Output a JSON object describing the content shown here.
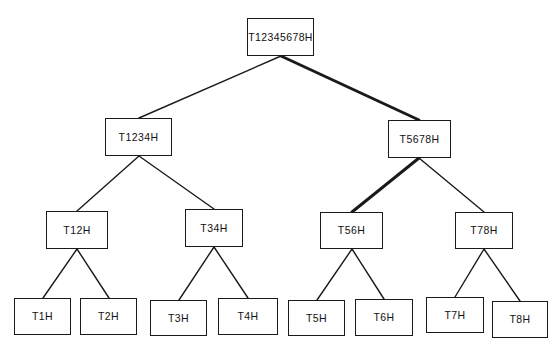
{
  "diagram": {
    "background_color": "#ffffff",
    "edge_color": "#1a1a1a",
    "node_border_color": "#1a1a1a",
    "node_fill_color": "#ffffff",
    "highlight_path_labels": [
      "T12345678H",
      "T5678H",
      "T56H"
    ]
  },
  "nodes": [
    {
      "id": "root",
      "label": "T12345678H",
      "level": 0,
      "x": 247,
      "y": 18,
      "w": 67,
      "h": 38
    },
    {
      "id": "t1234",
      "label": "T1234H",
      "level": 1,
      "x": 105,
      "y": 118,
      "w": 67,
      "h": 38
    },
    {
      "id": "t5678",
      "label": "T5678H",
      "level": 1,
      "x": 388,
      "y": 120,
      "w": 63,
      "h": 38
    },
    {
      "id": "t12",
      "label": "T12H",
      "level": 2,
      "x": 46,
      "y": 211,
      "w": 62,
      "h": 38
    },
    {
      "id": "t34",
      "label": "T34H",
      "level": 2,
      "x": 185,
      "y": 209,
      "w": 58,
      "h": 38
    },
    {
      "id": "t56",
      "label": "T56H",
      "level": 2,
      "x": 320,
      "y": 212,
      "w": 63,
      "h": 37
    },
    {
      "id": "t78",
      "label": "T78H",
      "level": 2,
      "x": 455,
      "y": 212,
      "w": 58,
      "h": 37
    },
    {
      "id": "t1",
      "label": "T1H",
      "level": 3,
      "x": 14,
      "y": 298,
      "w": 57,
      "h": 37
    },
    {
      "id": "t2",
      "label": "T2H",
      "level": 3,
      "x": 80,
      "y": 298,
      "w": 57,
      "h": 37
    },
    {
      "id": "t3",
      "label": "T3H",
      "level": 3,
      "x": 150,
      "y": 300,
      "w": 57,
      "h": 36
    },
    {
      "id": "t4",
      "label": "T4H",
      "level": 3,
      "x": 218,
      "y": 298,
      "w": 60,
      "h": 37
    },
    {
      "id": "t5",
      "label": "T5H",
      "level": 3,
      "x": 288,
      "y": 300,
      "w": 57,
      "h": 36
    },
    {
      "id": "t6",
      "label": "T6H",
      "level": 3,
      "x": 355,
      "y": 299,
      "w": 58,
      "h": 37
    },
    {
      "id": "t7",
      "label": "T7H",
      "level": 3,
      "x": 426,
      "y": 297,
      "w": 58,
      "h": 36
    },
    {
      "id": "t8",
      "label": "T8H",
      "level": 3,
      "x": 492,
      "y": 301,
      "w": 56,
      "h": 37
    }
  ],
  "edges": [
    {
      "from": "root",
      "to": "t1234",
      "x1": 281,
      "y1": 56,
      "x2": 139,
      "y2": 118,
      "weight": "normal",
      "width": 1.4
    },
    {
      "from": "root",
      "to": "t5678",
      "x1": 281,
      "y1": 56,
      "x2": 419,
      "y2": 120,
      "weight": "bold",
      "width": 3.0
    },
    {
      "from": "t1234",
      "to": "t12",
      "x1": 139,
      "y1": 156,
      "x2": 77,
      "y2": 211,
      "weight": "normal",
      "width": 1.4
    },
    {
      "from": "t1234",
      "to": "t34",
      "x1": 139,
      "y1": 156,
      "x2": 214,
      "y2": 209,
      "weight": "normal",
      "width": 1.4
    },
    {
      "from": "t5678",
      "to": "t56",
      "x1": 419,
      "y1": 158,
      "x2": 352,
      "y2": 212,
      "weight": "bold",
      "width": 3.0
    },
    {
      "from": "t5678",
      "to": "t78",
      "x1": 419,
      "y1": 158,
      "x2": 484,
      "y2": 212,
      "weight": "normal",
      "width": 1.4
    },
    {
      "from": "t12",
      "to": "t1",
      "x1": 77,
      "y1": 249,
      "x2": 43,
      "y2": 298,
      "weight": "normal",
      "width": 1.4
    },
    {
      "from": "t12",
      "to": "t2",
      "x1": 77,
      "y1": 249,
      "x2": 109,
      "y2": 298,
      "weight": "normal",
      "width": 1.4
    },
    {
      "from": "t34",
      "to": "t3",
      "x1": 214,
      "y1": 247,
      "x2": 179,
      "y2": 300,
      "weight": "normal",
      "width": 1.4
    },
    {
      "from": "t34",
      "to": "t4",
      "x1": 214,
      "y1": 247,
      "x2": 248,
      "y2": 298,
      "weight": "normal",
      "width": 1.4
    },
    {
      "from": "t56",
      "to": "t5",
      "x1": 352,
      "y1": 249,
      "x2": 317,
      "y2": 300,
      "weight": "normal",
      "width": 1.4
    },
    {
      "from": "t56",
      "to": "t6",
      "x1": 352,
      "y1": 249,
      "x2": 384,
      "y2": 299,
      "weight": "normal",
      "width": 1.4
    },
    {
      "from": "t78",
      "to": "t7",
      "x1": 484,
      "y1": 249,
      "x2": 455,
      "y2": 297,
      "weight": "normal",
      "width": 1.4
    },
    {
      "from": "t78",
      "to": "t8",
      "x1": 484,
      "y1": 249,
      "x2": 520,
      "y2": 301,
      "weight": "normal",
      "width": 1.4
    }
  ]
}
